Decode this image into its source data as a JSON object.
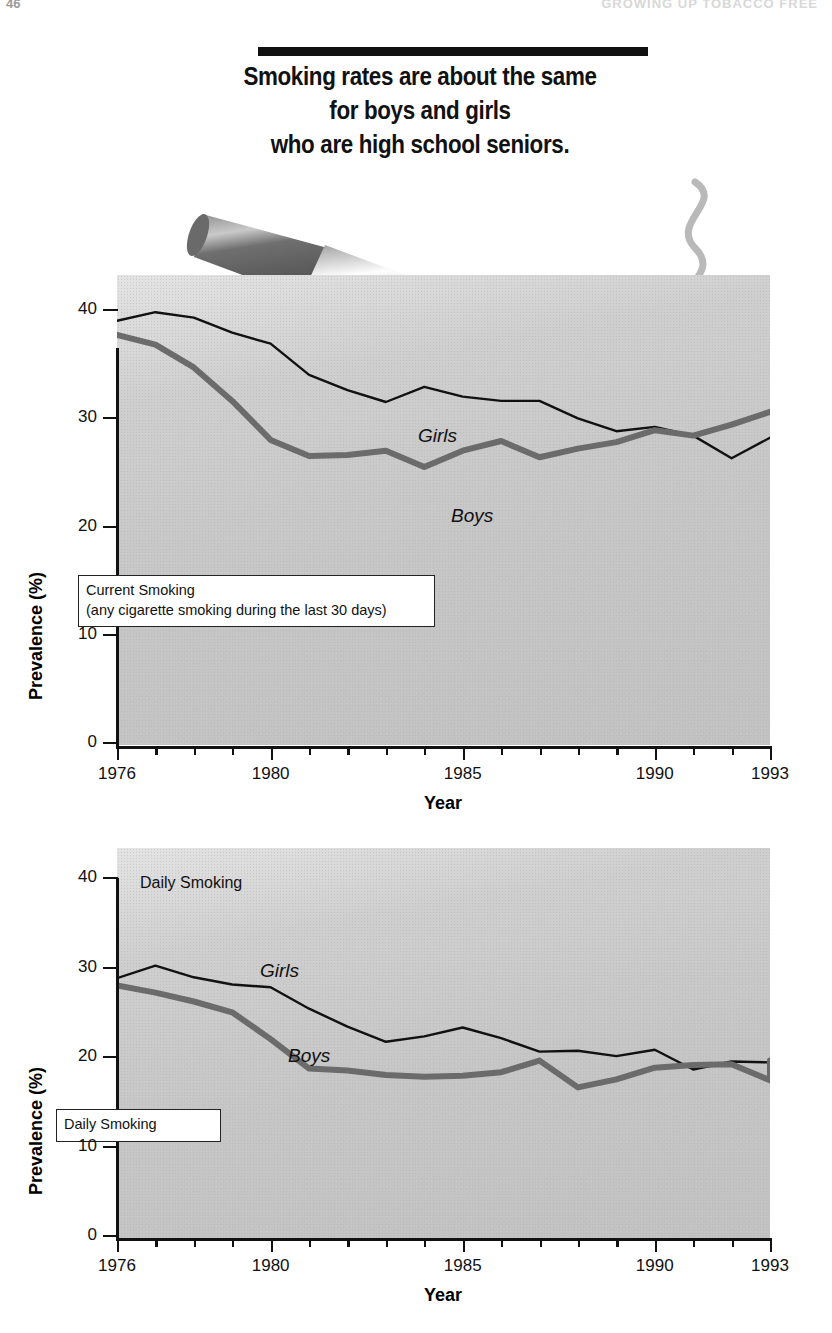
{
  "runhead": {
    "folio": "46",
    "title": "GROWING UP TOBACCO FREE"
  },
  "headline": {
    "line1": "Smoking rates are about the same",
    "line2": "for boys and girls",
    "line3": "who are high school seniors."
  },
  "artwork": {
    "cigarette_icon": "cigarette-icon",
    "smoke_icon": "smoke-curl-icon"
  },
  "chart_data": [
    {
      "id": "current-smoking",
      "type": "line",
      "title": "Current Smoking",
      "subtitle": "(any cigarette smoking during the last 30 days)",
      "xlabel": "Year",
      "ylabel": "Prevalence (%)",
      "xlim": [
        1976,
        1993
      ],
      "ylim": [
        0,
        40
      ],
      "yticks": [
        0,
        10,
        20,
        30,
        40
      ],
      "xticks": [
        1976,
        1980,
        1985,
        1990,
        1993
      ],
      "xtick_labels": [
        "1976",
        "1980",
        "1985",
        "1990",
        "1993"
      ],
      "grid": false,
      "legend_position": "inline-labels",
      "x": [
        1976,
        1977,
        1978,
        1979,
        1980,
        1981,
        1982,
        1983,
        1984,
        1985,
        1986,
        1987,
        1988,
        1989,
        1990,
        1991,
        1992,
        1993
      ],
      "series": [
        {
          "name": "Girls",
          "color": "#111111",
          "width": 2.4,
          "values": [
            39.0,
            39.8,
            39.3,
            37.9,
            36.9,
            34.0,
            32.6,
            31.5,
            32.9,
            32.0,
            31.6,
            31.6,
            30.0,
            28.8,
            29.2,
            28.4,
            26.3,
            28.2
          ]
        },
        {
          "name": "Boys",
          "color": "#6b6b6b",
          "width": 6.0,
          "values": [
            37.7,
            36.8,
            34.7,
            31.6,
            28.0,
            26.5,
            26.6,
            27.0,
            25.5,
            27.0,
            27.9,
            26.4,
            27.2,
            27.8,
            28.9,
            28.4,
            29.4,
            30.6
          ]
        }
      ]
    },
    {
      "id": "daily-smoking",
      "type": "line",
      "title": "Daily Smoking",
      "plot_note": "Daily Smoking",
      "xlabel": "Year",
      "ylabel": "Prevalence (%)",
      "xlim": [
        1976,
        1993
      ],
      "ylim": [
        0,
        40
      ],
      "yticks": [
        0,
        10,
        20,
        30,
        40
      ],
      "xticks": [
        1976,
        1980,
        1985,
        1990,
        1993
      ],
      "xtick_labels": [
        "1976",
        "1980",
        "1985",
        "1990",
        "1993"
      ],
      "grid": false,
      "legend_position": "inline-labels",
      "x": [
        1976,
        1977,
        1978,
        1979,
        1980,
        1981,
        1982,
        1983,
        1984,
        1985,
        1986,
        1987,
        1988,
        1989,
        1990,
        1991,
        1992,
        1993
      ],
      "series": [
        {
          "name": "Girls",
          "color": "#111111",
          "width": 2.4,
          "values": [
            28.8,
            30.2,
            28.9,
            28.1,
            27.8,
            25.4,
            23.4,
            21.7,
            22.3,
            23.3,
            22.1,
            20.6,
            20.7,
            20.1,
            20.8,
            18.6,
            19.5,
            19.4,
            18.5
          ]
        },
        {
          "name": "Boys",
          "color": "#6b6b6b",
          "width": 6.0,
          "values": [
            28.0,
            27.2,
            26.2,
            25.0,
            22.0,
            18.7,
            18.5,
            18.0,
            17.8,
            17.9,
            18.3,
            19.6,
            16.6,
            17.5,
            18.8,
            19.1,
            19.2,
            17.4,
            19.6
          ]
        }
      ]
    }
  ]
}
